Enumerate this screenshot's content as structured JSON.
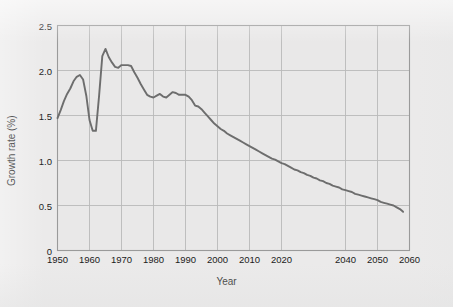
{
  "figure": {
    "background_color": "#ebeaea",
    "plot_background_color": "#e9e8e8",
    "frame_color": "#9a9a9a",
    "grid_color": "#b9b9b9",
    "line_color": "#6d6d6d",
    "text_color": "#1b1b1b"
  },
  "chart_data": {
    "type": "line",
    "title": "",
    "subtitle": "",
    "xlabel": "Year",
    "ylabel": "Growth rate (%)",
    "xlim": [
      1950,
      2060
    ],
    "ylim": [
      0,
      2.5
    ],
    "xticks": [
      1950,
      1960,
      1970,
      1980,
      1990,
      2000,
      2010,
      2020,
      2040,
      2050,
      2060
    ],
    "xtick_labels": [
      "1950",
      "1960",
      "1970",
      "1980",
      "1990",
      "2000",
      "2010",
      "2020",
      "2040",
      "2050",
      "2060"
    ],
    "yticks": [
      0,
      0.5,
      1.0,
      1.5,
      2.0,
      2.5
    ],
    "ytick_labels": [
      "0",
      "0.5",
      "1.0",
      "1.5",
      "2.0",
      "2.5"
    ],
    "grid": true,
    "grid_axis": "both",
    "legend": false,
    "legend_position": "none",
    "series": [
      {
        "name": "Growth rate",
        "color": "#6d6d6d",
        "line_width": 1.9,
        "x": [
          1950,
          1951,
          1952,
          1953,
          1954,
          1955,
          1956,
          1957,
          1958,
          1959,
          1960,
          1961,
          1962,
          1963,
          1964,
          1965,
          1966,
          1967,
          1968,
          1969,
          1970,
          1971,
          1972,
          1973,
          1974,
          1975,
          1976,
          1977,
          1978,
          1979,
          1980,
          1981,
          1982,
          1983,
          1984,
          1985,
          1986,
          1987,
          1988,
          1989,
          1990,
          1991,
          1992,
          1993,
          1994,
          1995,
          1996,
          1997,
          1998,
          1999,
          2000,
          2001,
          2002,
          2003,
          2004,
          2005,
          2006,
          2007,
          2008,
          2009,
          2010,
          2011,
          2012,
          2013,
          2014,
          2015,
          2016,
          2017,
          2018,
          2019,
          2020,
          2021,
          2022,
          2023,
          2024,
          2025,
          2026,
          2027,
          2028,
          2029,
          2030,
          2031,
          2032,
          2033,
          2034,
          2035,
          2036,
          2037,
          2038,
          2039,
          2040,
          2041,
          2042,
          2043,
          2044,
          2045,
          2046,
          2047,
          2048,
          2049,
          2050,
          2051,
          2052,
          2053,
          2054,
          2055,
          2056,
          2057,
          2058
        ],
        "y": [
          1.47,
          1.56,
          1.66,
          1.74,
          1.8,
          1.88,
          1.93,
          1.95,
          1.9,
          1.72,
          1.45,
          1.33,
          1.33,
          1.72,
          2.16,
          2.24,
          2.15,
          2.09,
          2.04,
          2.03,
          2.06,
          2.06,
          2.06,
          2.05,
          1.98,
          1.92,
          1.85,
          1.79,
          1.73,
          1.71,
          1.7,
          1.72,
          1.74,
          1.71,
          1.7,
          1.73,
          1.76,
          1.75,
          1.73,
          1.73,
          1.73,
          1.71,
          1.67,
          1.61,
          1.6,
          1.57,
          1.53,
          1.49,
          1.45,
          1.41,
          1.38,
          1.35,
          1.33,
          1.3,
          1.28,
          1.26,
          1.24,
          1.22,
          1.2,
          1.18,
          1.16,
          1.14,
          1.12,
          1.1,
          1.08,
          1.06,
          1.04,
          1.02,
          1.01,
          0.99,
          0.97,
          0.96,
          0.94,
          0.92,
          0.9,
          0.89,
          0.87,
          0.86,
          0.84,
          0.83,
          0.81,
          0.8,
          0.78,
          0.77,
          0.75,
          0.74,
          0.72,
          0.71,
          0.7,
          0.68,
          0.67,
          0.66,
          0.65,
          0.63,
          0.62,
          0.61,
          0.6,
          0.59,
          0.58,
          0.57,
          0.56,
          0.54,
          0.53,
          0.52,
          0.51,
          0.5,
          0.48,
          0.46,
          0.43
        ]
      }
    ]
  }
}
